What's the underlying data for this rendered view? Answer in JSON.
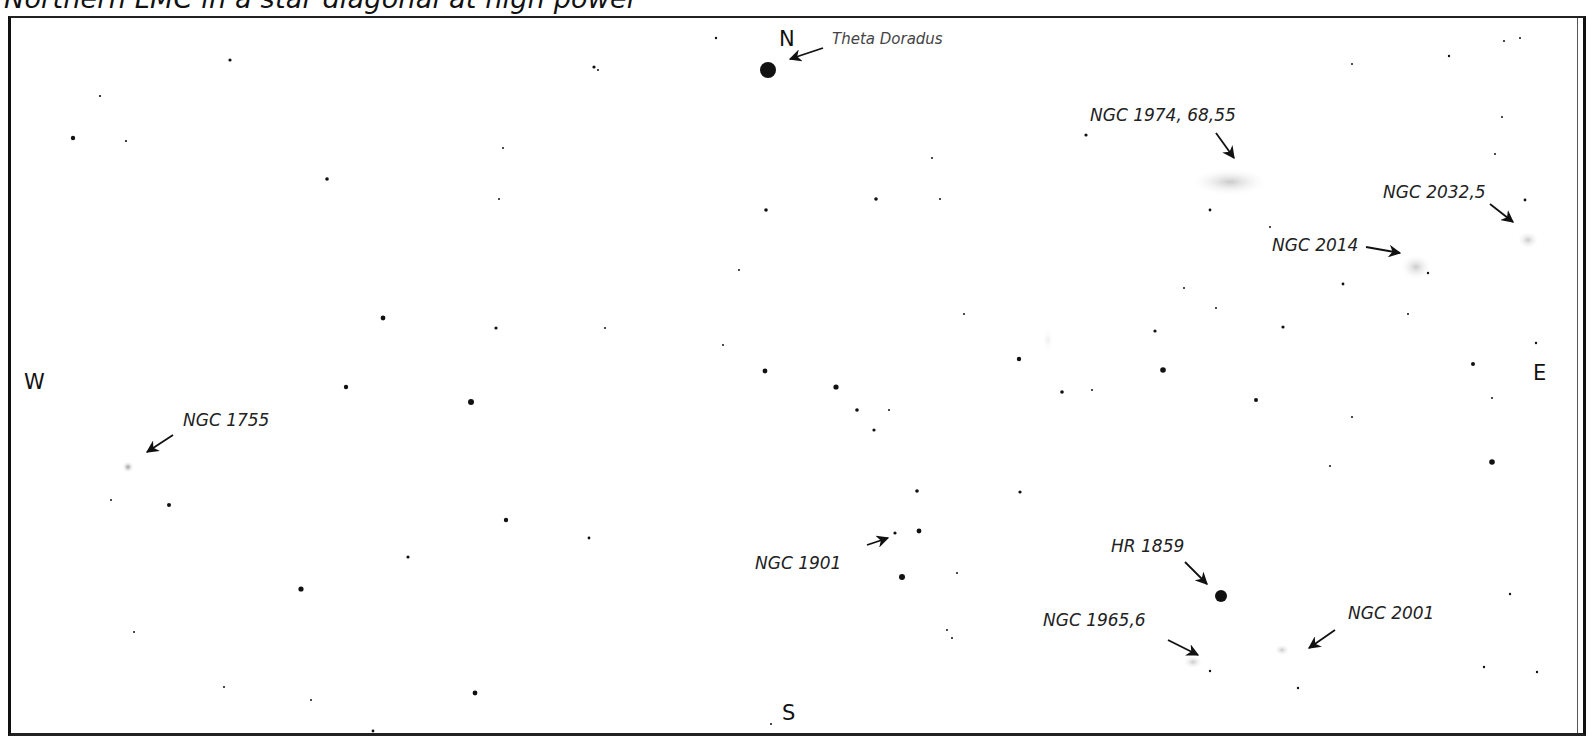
{
  "title": "Northern LMC in a star diagonal at high power",
  "directions": {
    "north": "N",
    "south": "S",
    "east": "E",
    "west": "W"
  },
  "labels": {
    "theta_doradus": "Theta Doradus",
    "ngc1974": "NGC 1974, 68,55",
    "ngc2032": "NGC 2032,5",
    "ngc2014": "NGC 2014",
    "ngc1755": "NGC 1755",
    "ngc1901": "NGC 1901",
    "hr1859": "HR 1859",
    "ngc1965": "NGC 1965,6",
    "ngc2001": "NGC 2001"
  },
  "colors": {
    "star": "#111111",
    "nebula": "#bdbdbd",
    "frame": "#1a1a1a",
    "label": "#222222"
  }
}
